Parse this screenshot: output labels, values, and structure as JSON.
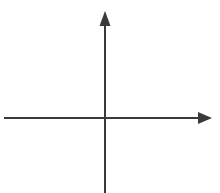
{
  "figure": {
    "kind": "cartesian-axes-diagram",
    "width": 220,
    "height": 193,
    "background_color": "#ffffff",
    "stroke_color": "#3a3a3a",
    "has_border": false,
    "has_gridlines": false,
    "has_tick_marks": false,
    "has_tick_labels": false,
    "has_axis_titles": false,
    "has_legend": false,
    "has_plotted_data": false,
    "title": "",
    "subtitle": "",
    "caption": ""
  },
  "chart_data": {
    "type": "line",
    "title": "",
    "xlabel": "",
    "ylabel": "",
    "grid": false,
    "legend": null,
    "legend_position": "none",
    "xlim": [
      -1,
      1
    ],
    "ylim": [
      -1,
      1
    ],
    "xticks": [],
    "yticks": [],
    "xtick_labels": [],
    "ytick_labels": [],
    "annotations": [],
    "series": []
  },
  "axes": {
    "origin": {
      "x": 105,
      "y": 118
    },
    "stroke_width": 2,
    "x_axis": {
      "name": "horizontal-axis",
      "label": "",
      "orientation": "horizontal",
      "y": 118,
      "start_x": 4,
      "end_x": 200,
      "arrow_direction": "right",
      "arrow_tip_x": 212,
      "arrow_base_x": 199,
      "arrow_half_height": 6,
      "extends_past_origin_negative": true,
      "extends_past_origin_positive": true
    },
    "y_axis": {
      "name": "vertical-axis",
      "label": "",
      "orientation": "vertical",
      "x": 105,
      "start_y": 26,
      "end_y": 193,
      "arrow_direction": "up",
      "arrow_tip_y": 11,
      "arrow_base_y": 26,
      "arrow_half_width": 5.5,
      "extends_past_origin_positive": true,
      "extends_past_origin_negative": true
    }
  },
  "quadrants": {
    "q1_label": "",
    "q2_label": "",
    "q3_label": "",
    "q4_label": ""
  }
}
